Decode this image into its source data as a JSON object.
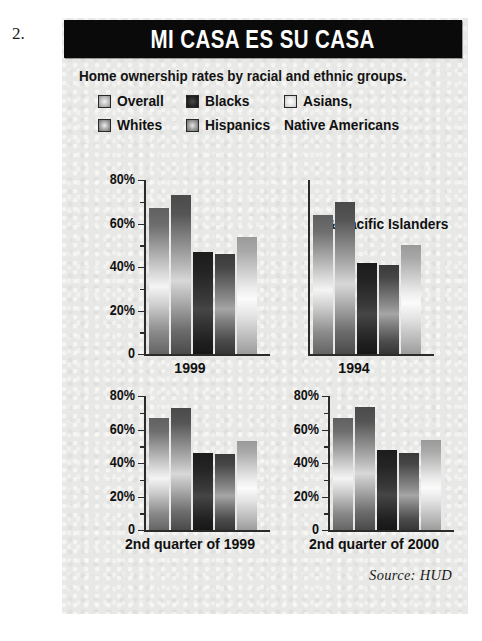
{
  "list_number": "2.",
  "figure": {
    "title": "MI CASA ES SU CASA",
    "subtitle": "Home ownership rates by racial and ethnic groups.",
    "source": "Source: HUD"
  },
  "legend": {
    "items": [
      {
        "label": "Overall",
        "swatch": "swatch-overall",
        "color": "#bdbdbd"
      },
      {
        "label": "Blacks",
        "swatch": "swatch-blacks",
        "color": "#2a2a2a"
      },
      {
        "label": "Asians,",
        "swatch": "swatch-asians",
        "color": "#e4e4e4"
      },
      {
        "label": "Whites",
        "swatch": "swatch-whites",
        "color": "#a5a5a5"
      },
      {
        "label": "Hispanics",
        "swatch": "swatch-hispanics",
        "color": "#9b9b9b"
      }
    ],
    "continuation_line_1": "Native Americans",
    "continuation_line_2": "& Pacific Islanders"
  },
  "chart_data": [
    {
      "type": "bar",
      "title": "1999",
      "categories": [
        "Overall",
        "Whites",
        "Blacks",
        "Hispanics",
        "Asians, Native Americans & Pacific Islanders"
      ],
      "values": [
        67,
        73,
        47,
        46,
        54
      ],
      "xlabel": "1999",
      "ylabel": "",
      "ylim": [
        0,
        80
      ],
      "ytick_labels": [
        "80%",
        "60%",
        "40%",
        "20%",
        "0"
      ],
      "ytick_values": [
        80,
        60,
        40,
        20,
        0
      ],
      "minor_ticks": [
        70,
        50,
        30,
        10
      ],
      "grid": false,
      "legend_position": "top"
    },
    {
      "type": "bar",
      "title": "1994",
      "categories": [
        "Overall",
        "Whites",
        "Blacks",
        "Hispanics",
        "Asians, Native Americans & Pacific Islanders"
      ],
      "values": [
        64,
        70,
        42,
        41,
        50
      ],
      "xlabel": "1994",
      "ylabel": "",
      "ylim": [
        0,
        80
      ],
      "ytick_labels": [],
      "ytick_values": [],
      "minor_ticks": [],
      "grid": false,
      "legend_position": "top"
    },
    {
      "type": "bar",
      "title": "2nd quarter of 1999",
      "categories": [
        "Overall",
        "Whites",
        "Blacks",
        "Hispanics",
        "Asians, Native Americans & Pacific Islanders"
      ],
      "values": [
        67,
        73,
        46,
        45.5,
        53
      ],
      "xlabel": "2nd quarter of 1999",
      "ylabel": "",
      "ylim": [
        0,
        80
      ],
      "ytick_labels": [
        "80%",
        "60%",
        "40%",
        "20%",
        "0"
      ],
      "ytick_values": [
        80,
        60,
        40,
        20,
        0
      ],
      "minor_ticks": [
        70,
        50,
        30,
        10
      ],
      "grid": false,
      "legend_position": "none"
    },
    {
      "type": "bar",
      "title": "2nd quarter of 2000",
      "categories": [
        "Overall",
        "Whites",
        "Blacks",
        "Hispanics",
        "Asians, Native Americans & Pacific Islanders"
      ],
      "values": [
        67,
        73.5,
        47.5,
        46,
        54
      ],
      "xlabel": "2nd quarter of 2000",
      "ylabel": "",
      "ylim": [
        0,
        80
      ],
      "ytick_labels": [
        "80%",
        "60%",
        "40%",
        "20%",
        "0"
      ],
      "ytick_values": [
        80,
        60,
        40,
        20,
        0
      ],
      "minor_ticks": [
        70,
        50,
        30,
        10
      ],
      "grid": false,
      "legend_position": "none"
    }
  ]
}
